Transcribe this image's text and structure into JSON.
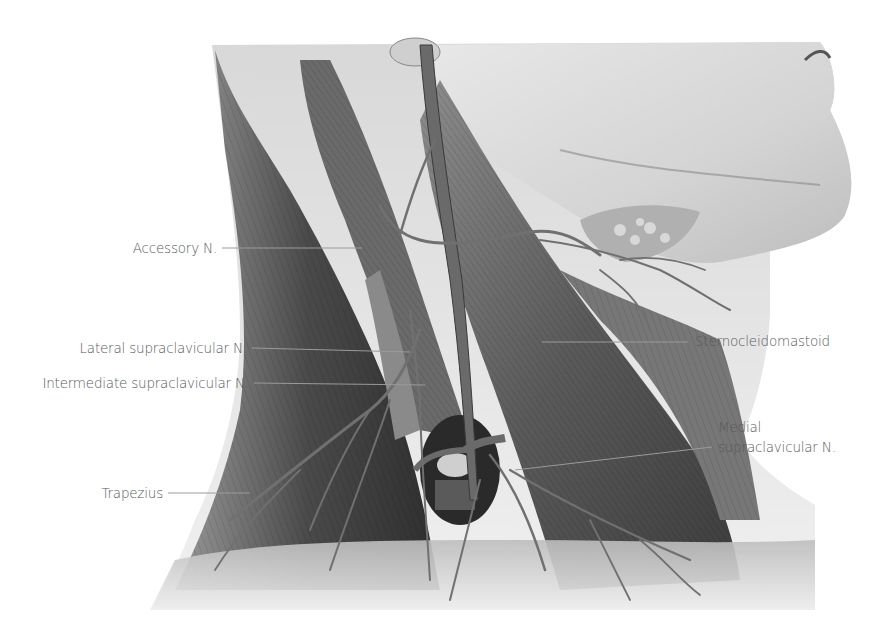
{
  "figure": {
    "style": "grayscale anatomical pencil illustration"
  },
  "labels": [
    {
      "id": "accessory",
      "text": "Accessory N.",
      "side": "left"
    },
    {
      "id": "lateral-supraclavicular",
      "text": "Lateral supraclavicular N.",
      "side": "left"
    },
    {
      "id": "intermediate-supraclavicular",
      "text": "Intermediate supraclavicular N.",
      "side": "left"
    },
    {
      "id": "trapezius",
      "text": "Trapezius",
      "side": "left"
    },
    {
      "id": "sternocleidomastoid",
      "text": "Sternocleidomastoid",
      "side": "right"
    },
    {
      "id": "medial-supraclavicular-1",
      "text": "Medial",
      "side": "right"
    },
    {
      "id": "medial-supraclavicular-2",
      "text": "supraclavicular N.",
      "side": "right"
    }
  ],
  "colors": {
    "label_text": "#5a5a5a",
    "leader_line": "#9a9a9a",
    "muscle_dark": "#3a3a3a",
    "muscle_mid": "#7a7a7a",
    "skin_light": "#e6e6e6",
    "nerve": "#6e6e6e"
  }
}
